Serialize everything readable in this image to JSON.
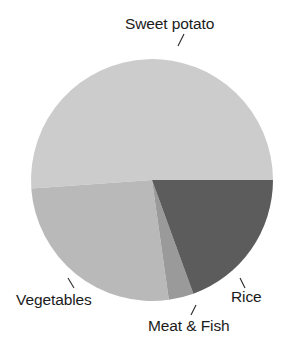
{
  "chart_data": {
    "type": "pie",
    "title": "",
    "subtitle": "",
    "xlabel": "",
    "ylabel": "",
    "legend_position": "none",
    "grid": false,
    "labels_placement": "outside-with-leader-lines",
    "categories": [
      "Sweet potato",
      "Vegetables",
      "Rice",
      "Meat & Fish"
    ],
    "values": [
      51,
      26,
      19,
      4
    ],
    "units": "percent",
    "slices": [
      {
        "label": "Sweet potato",
        "value": 51,
        "color": "#cccccc",
        "start_angle_deg": 0,
        "end_angle_deg": 184,
        "direction": "counterclockwise"
      },
      {
        "label": "Vegetables",
        "value": 26,
        "color": "#b9b9b9",
        "start_angle_deg": 184,
        "end_angle_deg": 278,
        "direction": "counterclockwise"
      },
      {
        "label": "Meat & Fish",
        "value": 4,
        "color": "#9a9a9a",
        "start_angle_deg": 278,
        "end_angle_deg": 290,
        "direction": "counterclockwise"
      },
      {
        "label": "Rice",
        "value": 19,
        "color": "#5c5c5c",
        "start_angle_deg": 290,
        "end_angle_deg": 360,
        "direction": "counterclockwise"
      }
    ],
    "geometry": {
      "center_x": 152,
      "center_y": 180,
      "radius": 121
    }
  },
  "labels": {
    "sweet_potato": "Sweet potato",
    "vegetables": "Vegetables",
    "meat_and_fish": "Meat & Fish",
    "rice": "Rice"
  },
  "colors": {
    "background": "#ffffff",
    "text": "#1b1b1b",
    "leader_line": "#2a2a2a",
    "sweet_potato": "#cccccc",
    "vegetables": "#b9b9b9",
    "meat_and_fish": "#9a9a9a",
    "rice": "#5c5c5c"
  }
}
